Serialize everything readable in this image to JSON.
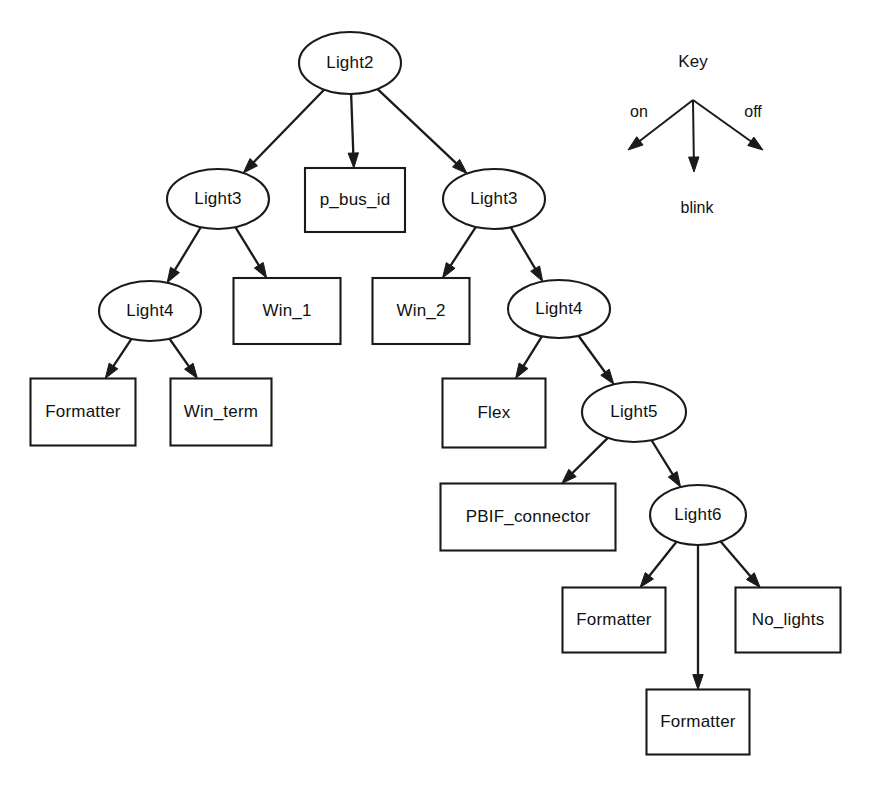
{
  "diagram": {
    "colors": {
      "stroke": "#1a1a1a",
      "fill": "#ffffff",
      "text": "#111111",
      "background": "#ffffff"
    },
    "nodes": [
      {
        "id": "n0",
        "label": "Light2",
        "shape": "ellipse",
        "cx": 350,
        "cy": 63,
        "rx": 51,
        "ry": 31
      },
      {
        "id": "n1",
        "label": "Light3",
        "shape": "ellipse",
        "cx": 218,
        "cy": 199,
        "rx": 51,
        "ry": 30
      },
      {
        "id": "n2",
        "label": "p_bus_id",
        "shape": "rectangle",
        "cx": 355,
        "cy": 200,
        "w": 100,
        "h": 64
      },
      {
        "id": "n3",
        "label": "Light3",
        "shape": "ellipse",
        "cx": 494,
        "cy": 199,
        "rx": 51,
        "ry": 30
      },
      {
        "id": "n4",
        "label": "Light4",
        "shape": "ellipse",
        "cx": 150,
        "cy": 311,
        "rx": 51,
        "ry": 30
      },
      {
        "id": "n5",
        "label": "Win_1",
        "shape": "rectangle",
        "cx": 287,
        "cy": 311,
        "w": 107,
        "h": 66
      },
      {
        "id": "n6",
        "label": "Win_2",
        "shape": "rectangle",
        "cx": 421,
        "cy": 311,
        "w": 97,
        "h": 66
      },
      {
        "id": "n7",
        "label": "Light4",
        "shape": "ellipse",
        "cx": 559,
        "cy": 309,
        "rx": 51,
        "ry": 29
      },
      {
        "id": "n8",
        "label": "Formatter",
        "shape": "rectangle",
        "cx": 83,
        "cy": 412,
        "w": 105,
        "h": 67
      },
      {
        "id": "n9",
        "label": "Win_term",
        "shape": "rectangle",
        "cx": 221,
        "cy": 412,
        "w": 101,
        "h": 67
      },
      {
        "id": "n10",
        "label": "Flex",
        "shape": "rectangle",
        "cx": 494,
        "cy": 413,
        "w": 103,
        "h": 69
      },
      {
        "id": "n11",
        "label": "Light5",
        "shape": "ellipse",
        "cx": 634,
        "cy": 412,
        "rx": 52,
        "ry": 30
      },
      {
        "id": "n12",
        "label": "PBIF_connector",
        "shape": "rectangle",
        "cx": 528,
        "cy": 517,
        "w": 175,
        "h": 67
      },
      {
        "id": "n13",
        "label": "Light6",
        "shape": "ellipse",
        "cx": 698,
        "cy": 515,
        "rx": 48,
        "ry": 30
      },
      {
        "id": "n14",
        "label": "Formatter",
        "shape": "rectangle",
        "cx": 614,
        "cy": 620,
        "w": 103,
        "h": 65
      },
      {
        "id": "n15",
        "label": "No_lights",
        "shape": "rectangle",
        "cx": 788,
        "cy": 620,
        "w": 105,
        "h": 65
      },
      {
        "id": "n16",
        "label": "Formatter",
        "shape": "rectangle",
        "cx": 698,
        "cy": 722,
        "w": 103,
        "h": 65
      }
    ],
    "edges": [
      {
        "from": "n0",
        "to": "n1",
        "transition": "on"
      },
      {
        "from": "n0",
        "to": "n2",
        "transition": "blink"
      },
      {
        "from": "n0",
        "to": "n3",
        "transition": "off"
      },
      {
        "from": "n1",
        "to": "n4",
        "transition": "on"
      },
      {
        "from": "n1",
        "to": "n5",
        "transition": "off"
      },
      {
        "from": "n3",
        "to": "n6",
        "transition": "on"
      },
      {
        "from": "n3",
        "to": "n7",
        "transition": "off"
      },
      {
        "from": "n4",
        "to": "n8",
        "transition": "on"
      },
      {
        "from": "n4",
        "to": "n9",
        "transition": "off"
      },
      {
        "from": "n7",
        "to": "n10",
        "transition": "on"
      },
      {
        "from": "n7",
        "to": "n11",
        "transition": "off"
      },
      {
        "from": "n11",
        "to": "n12",
        "transition": "on"
      },
      {
        "from": "n11",
        "to": "n13",
        "transition": "off"
      },
      {
        "from": "n13",
        "to": "n14",
        "transition": "on"
      },
      {
        "from": "n13",
        "to": "n16",
        "transition": "blink"
      },
      {
        "from": "n13",
        "to": "n15",
        "transition": "off"
      }
    ]
  },
  "key": {
    "title": "Key",
    "origin": {
      "x": 693,
      "y": 100
    },
    "branches": [
      {
        "label": "on",
        "label_x": 639,
        "label_y": 113,
        "end_x": 628,
        "end_y": 150
      },
      {
        "label": "blink",
        "label_x": 697,
        "label_y": 209,
        "end_x": 694,
        "end_y": 172
      },
      {
        "label": "off",
        "label_x": 753,
        "label_y": 113,
        "end_x": 763,
        "end_y": 150
      }
    ]
  }
}
